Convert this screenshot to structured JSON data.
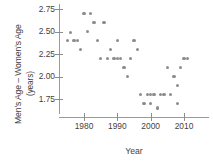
{
  "chart_data": {
    "type": "scatter",
    "title": "",
    "xlabel": "Year",
    "ylabel": "Men's Age – Women's Age (years)",
    "ylabel_line1": "Men's Age – Women's Age",
    "ylabel_line2": "(years)",
    "xlim": [
      1974,
      2013
    ],
    "ylim": [
      1.58,
      2.8
    ],
    "xticks": [
      1980,
      1990,
      2000,
      2010
    ],
    "xtick_labels": [
      "1980",
      "1990",
      "2000",
      "2010"
    ],
    "yticks": [
      1.75,
      2.0,
      2.25,
      2.5,
      2.75
    ],
    "ytick_labels": [
      "1.75",
      "2.00",
      "2.25",
      "2.50",
      "2.75"
    ],
    "grid": false,
    "legend": false,
    "marker": "circle",
    "marker_color": "#8c8c8c",
    "axis_color": "#9a9a9a",
    "text_color": "#3f3f3f",
    "points": [
      {
        "x": 1975,
        "y": 2.4
      },
      {
        "x": 1976,
        "y": 2.49
      },
      {
        "x": 1977,
        "y": 2.4
      },
      {
        "x": 1978,
        "y": 2.4
      },
      {
        "x": 1979,
        "y": 2.3
      },
      {
        "x": 1980,
        "y": 2.7
      },
      {
        "x": 1981,
        "y": 2.5
      },
      {
        "x": 1982,
        "y": 2.7
      },
      {
        "x": 1983,
        "y": 2.6
      },
      {
        "x": 1984,
        "y": 2.4
      },
      {
        "x": 1985,
        "y": 2.2
      },
      {
        "x": 1986,
        "y": 2.6
      },
      {
        "x": 1987,
        "y": 2.2
      },
      {
        "x": 1988,
        "y": 2.3
      },
      {
        "x": 1989,
        "y": 2.2
      },
      {
        "x": 1990,
        "y": 2.4
      },
      {
        "x": 1990,
        "y": 2.2
      },
      {
        "x": 1991,
        "y": 2.2
      },
      {
        "x": 1992,
        "y": 2.1
      },
      {
        "x": 1993,
        "y": 2.0
      },
      {
        "x": 1994,
        "y": 2.2
      },
      {
        "x": 1995,
        "y": 2.4
      },
      {
        "x": 1996,
        "y": 2.3
      },
      {
        "x": 1997,
        "y": 1.8
      },
      {
        "x": 1998,
        "y": 1.7
      },
      {
        "x": 1999,
        "y": 1.8
      },
      {
        "x": 2000,
        "y": 1.7
      },
      {
        "x": 2000,
        "y": 1.8
      },
      {
        "x": 2001,
        "y": 1.8
      },
      {
        "x": 2002,
        "y": 1.65
      },
      {
        "x": 2003,
        "y": 1.8
      },
      {
        "x": 2004,
        "y": 1.8
      },
      {
        "x": 2005,
        "y": 2.1
      },
      {
        "x": 2006,
        "y": 1.8
      },
      {
        "x": 2007,
        "y": 2.0
      },
      {
        "x": 2008,
        "y": 1.9
      },
      {
        "x": 2008,
        "y": 1.7
      },
      {
        "x": 2009,
        "y": 2.1
      },
      {
        "x": 2010,
        "y": 2.2
      },
      {
        "x": 2011,
        "y": 2.2
      }
    ]
  }
}
